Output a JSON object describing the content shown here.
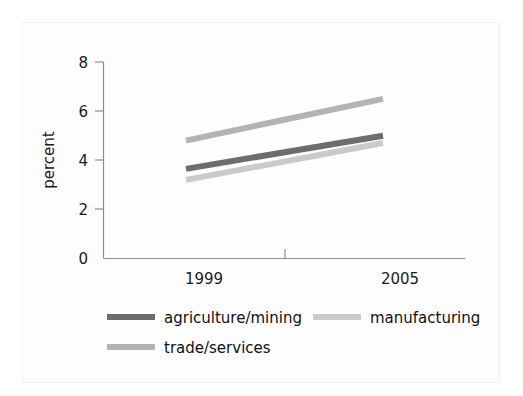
{
  "chart_data": {
    "type": "line",
    "title": "",
    "subtitle": "",
    "xlabel": "",
    "ylabel": "percent",
    "x": [
      1999,
      2005
    ],
    "x_tick_labels": [
      "1999",
      "2005"
    ],
    "xlim": [
      1999,
      2005
    ],
    "ylim": [
      0,
      8
    ],
    "y_ticks": [
      0,
      2,
      4,
      6,
      8
    ],
    "y_tick_labels": [
      "0",
      "2",
      "4",
      "6",
      "8"
    ],
    "grid": false,
    "legend_position": "bottom-left",
    "series": [
      {
        "name": "agriculture/mining",
        "values": [
          3.65,
          5.0
        ],
        "color": "#6d6d6d"
      },
      {
        "name": "manufacturing",
        "values": [
          3.2,
          4.7
        ],
        "color": "#cacaca"
      },
      {
        "name": "trade/services",
        "values": [
          4.8,
          6.5
        ],
        "color": "#b3b3b3"
      }
    ],
    "annotations": []
  },
  "axes": {
    "y_title": "percent",
    "y_tick_0": "0",
    "y_tick_2": "2",
    "y_tick_4": "4",
    "y_tick_6": "6",
    "y_tick_8": "8",
    "x_tick_left": "1999",
    "x_tick_right": "2005"
  },
  "legend": {
    "items": [
      {
        "label": "agriculture/mining",
        "color": "#6d6d6d"
      },
      {
        "label": "manufacturing",
        "color": "#cacaca"
      },
      {
        "label": "trade/services",
        "color": "#b3b3b3"
      }
    ]
  },
  "colors": {
    "background": "#ffffff",
    "panel": "#fdfdfd",
    "frame_border": "#f2f2f2",
    "axis": "#8c8c8c",
    "text": "#1a1a1a"
  }
}
